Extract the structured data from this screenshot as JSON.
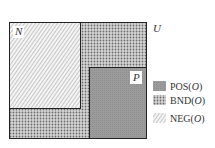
{
  "diagram": {
    "universe_label": "U",
    "regions": {
      "negative": {
        "label": "N"
      },
      "positive": {
        "label": "P"
      }
    },
    "legend": [
      {
        "key": "POS",
        "arg": "O",
        "pattern": "solid-gray",
        "color": "#9a9a9a"
      },
      {
        "key": "BND",
        "arg": "O",
        "pattern": "dotted-crosshatch",
        "color": "#6f6f6f"
      },
      {
        "key": "NEG",
        "arg": "O",
        "pattern": "diagonal-hatch",
        "color": "#aaaaaa"
      }
    ]
  }
}
